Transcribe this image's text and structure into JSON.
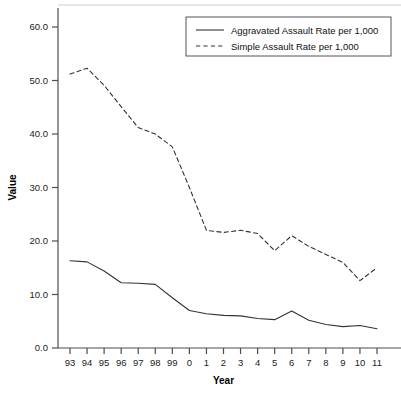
{
  "page": {
    "title_remnant": "",
    "background": "#ffffff"
  },
  "chart_data": {
    "type": "line",
    "title": "",
    "xlabel": "Year",
    "ylabel": "Value",
    "grid": false,
    "legend_position": "top-right",
    "xlim": [
      0,
      18
    ],
    "ylim": [
      0.0,
      60.0
    ],
    "ytick_labels": [
      "0.0",
      "10.0",
      "20.0",
      "30.0",
      "40.0",
      "50.0",
      "60.0"
    ],
    "ytick_values": [
      0,
      10,
      20,
      30,
      40,
      50,
      60
    ],
    "categories": [
      "93",
      "94",
      "95",
      "96",
      "97",
      "98",
      "99",
      "0",
      "1",
      "2",
      "3",
      "4",
      "5",
      "6",
      "7",
      "8",
      "9",
      "10",
      "11"
    ],
    "series": [
      {
        "name": "Aggravated Assault Rate per 1,000",
        "style": "solid",
        "color": "#333333",
        "values": [
          16.3,
          16.1,
          14.4,
          12.2,
          12.1,
          11.9,
          9.4,
          7.0,
          6.4,
          6.1,
          6.0,
          5.5,
          5.3,
          6.9,
          5.2,
          4.4,
          4.0,
          4.2,
          3.6
        ]
      },
      {
        "name": "Simple Assault Rate per 1,000",
        "style": "dashed",
        "color": "#333333",
        "values": [
          51.2,
          52.3,
          49.1,
          45.1,
          41.2,
          40.0,
          37.6,
          30.0,
          22.0,
          21.6,
          22.0,
          21.4,
          18.2,
          21.0,
          19.0,
          17.5,
          16.0,
          12.6,
          15.0
        ]
      }
    ]
  },
  "legend": {
    "items": [
      {
        "label": "Aggravated Assault Rate per 1,000",
        "style": "solid"
      },
      {
        "label": "Simple Assault Rate per 1,000",
        "style": "dashed"
      }
    ]
  }
}
